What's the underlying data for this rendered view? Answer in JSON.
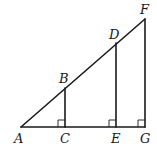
{
  "figure": {
    "points": {
      "A": {
        "label": "A",
        "x": 21,
        "y": 127
      },
      "B": {
        "label": "B",
        "x": 65,
        "y": 88
      },
      "C": {
        "label": "C",
        "x": 65,
        "y": 127
      },
      "D": {
        "label": "D",
        "x": 116,
        "y": 43
      },
      "E": {
        "label": "E",
        "x": 116,
        "y": 127
      },
      "F": {
        "label": "F",
        "x": 145,
        "y": 19
      },
      "G": {
        "label": "G",
        "x": 145,
        "y": 127
      }
    },
    "segments": [
      {
        "name": "AF",
        "from": "A",
        "to": "F"
      },
      {
        "name": "AG",
        "from": "A",
        "to": "G"
      },
      {
        "name": "BC",
        "from": "B",
        "to": "C"
      },
      {
        "name": "DE",
        "from": "D",
        "to": "E"
      },
      {
        "name": "FG",
        "from": "F",
        "to": "G"
      }
    ],
    "right_angles": [
      "C",
      "E",
      "G"
    ],
    "labels": {
      "A": "A",
      "B": "B",
      "C": "C",
      "D": "D",
      "E": "E",
      "F": "F",
      "G": "G"
    }
  }
}
